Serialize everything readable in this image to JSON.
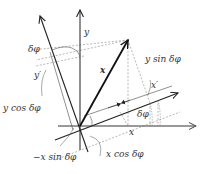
{
  "diagram": {
    "colors": {
      "axis_original": "#777777",
      "axis_rotated": "#222222",
      "vector": "#111111",
      "dashed": "#999999"
    },
    "labels": {
      "y_axis": "y",
      "x_axis": "x",
      "y_prime_axis": "y′",
      "x_prime_axis": "x′",
      "vector": "x",
      "delta_phi_top": "δφ",
      "delta_phi_right": "δφ",
      "y_sin": "y sin δφ",
      "y_cos": "y cos δφ",
      "x_cos": "x cos δφ",
      "neg_x_sin": "−x sin δφ"
    }
  }
}
